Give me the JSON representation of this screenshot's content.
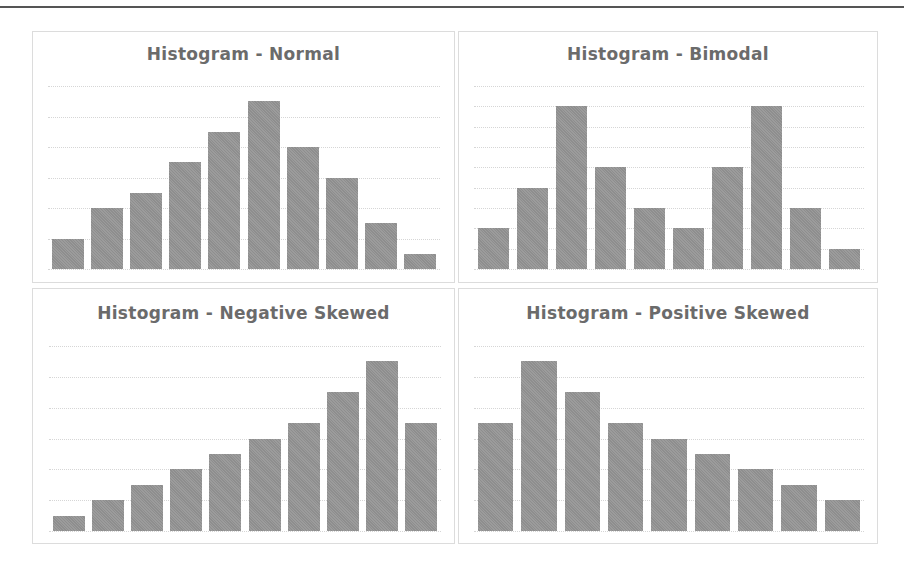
{
  "chart_data": [
    {
      "type": "bar",
      "title": "Histogram - Normal",
      "categories": [
        "1",
        "2",
        "3",
        "4",
        "5",
        "6",
        "7",
        "8",
        "9",
        "10"
      ],
      "values": [
        1,
        2,
        2.5,
        3.5,
        4.5,
        5.5,
        4,
        3,
        1.5,
        0.5
      ],
      "xlabel": "",
      "ylabel": "",
      "ylim": [
        0,
        6
      ],
      "gridlines": 6,
      "grid": true,
      "legend": "none",
      "bar_color": "#8e8e8e"
    },
    {
      "type": "bar",
      "title": "Histogram - Bimodal",
      "categories": [
        "1",
        "2",
        "3",
        "4",
        "5",
        "6",
        "7",
        "8",
        "9",
        "10"
      ],
      "values": [
        2,
        4,
        8,
        5,
        3,
        2,
        5,
        8,
        3,
        1
      ],
      "xlabel": "",
      "ylabel": "",
      "ylim": [
        0,
        9
      ],
      "gridlines": 9,
      "grid": true,
      "legend": "none",
      "bar_color": "#8e8e8e"
    },
    {
      "type": "bar",
      "title": "Histogram - Negative Skewed",
      "categories": [
        "1",
        "2",
        "3",
        "4",
        "5",
        "6",
        "7",
        "8",
        "9",
        "10"
      ],
      "values": [
        0.5,
        1,
        1.5,
        2,
        2.5,
        3,
        3.5,
        4.5,
        5.5,
        3.5
      ],
      "xlabel": "",
      "ylabel": "",
      "ylim": [
        0,
        6
      ],
      "gridlines": 6,
      "grid": true,
      "legend": "none",
      "bar_color": "#8e8e8e"
    },
    {
      "type": "bar",
      "title": "Histogram - Positive Skewed",
      "categories": [
        "1",
        "2",
        "3",
        "4",
        "5",
        "6",
        "7",
        "8",
        "9"
      ],
      "values": [
        3.5,
        5.5,
        4.5,
        3.5,
        3,
        2.5,
        2,
        1.5,
        1
      ],
      "xlabel": "",
      "ylabel": "",
      "ylim": [
        0,
        6
      ],
      "gridlines": 6,
      "grid": true,
      "legend": "none",
      "bar_color": "#8e8e8e"
    }
  ],
  "panels": [
    {
      "title": "Histogram - Normal"
    },
    {
      "title": "Histogram - Bimodal"
    },
    {
      "title": "Histogram - Negative Skewed"
    },
    {
      "title": "Histogram - Positive Skewed"
    }
  ]
}
